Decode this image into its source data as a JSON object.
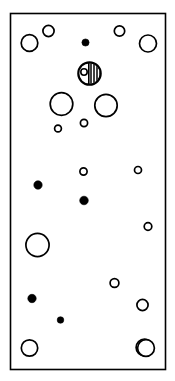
{
  "figure": {
    "type": "scientific-illustration",
    "canvas": {
      "width": 175,
      "height": 381
    },
    "background_color": "#ffffff",
    "stroke_color": "#000000",
    "fill_color": "#000000",
    "open_fill_color": "#ffffff"
  },
  "frame": {
    "name": "outer-rectangle",
    "x": 10.5,
    "y": 13.5,
    "width": 155,
    "height": 356,
    "stroke_width": 1.6
  },
  "chart_data": {
    "type": "scatter",
    "title": "",
    "xlabel": "",
    "ylabel": "",
    "xlim": [
      10,
      166
    ],
    "ylim": [
      13,
      370
    ],
    "grid": false,
    "legend": null,
    "series": [
      {
        "name": "open-circles",
        "style": "open",
        "stroke": "#000000",
        "fill": "#ffffff",
        "stroke_width": 1.7,
        "points": [
          {
            "id": "oc-1",
            "cx": 29.5,
            "cy": 43.0,
            "r": 8.3
          },
          {
            "id": "oc-2",
            "cx": 48.5,
            "cy": 31.0,
            "r": 5.6
          },
          {
            "id": "oc-3",
            "cx": 119.5,
            "cy": 31.0,
            "r": 5.2
          },
          {
            "id": "oc-4",
            "cx": 148.0,
            "cy": 43.5,
            "r": 8.5
          },
          {
            "id": "oc-5",
            "cx": 61.5,
            "cy": 104.0,
            "r": 11.3
          },
          {
            "id": "oc-6",
            "cx": 106.0,
            "cy": 105.5,
            "r": 11.2
          },
          {
            "id": "oc-7",
            "cx": 84.0,
            "cy": 123.0,
            "r": 3.6
          },
          {
            "id": "oc-8",
            "cx": 58.0,
            "cy": 128.5,
            "r": 3.4
          },
          {
            "id": "oc-9",
            "cx": 83.5,
            "cy": 171.5,
            "r": 3.6
          },
          {
            "id": "oc-10",
            "cx": 138.0,
            "cy": 170.0,
            "r": 3.5
          },
          {
            "id": "oc-11",
            "cx": 148.0,
            "cy": 226.5,
            "r": 3.8
          },
          {
            "id": "oc-12",
            "cx": 37.5,
            "cy": 245.0,
            "r": 11.6
          },
          {
            "id": "oc-13",
            "cx": 114.5,
            "cy": 283.0,
            "r": 4.4
          },
          {
            "id": "oc-14",
            "cx": 142.5,
            "cy": 305.0,
            "r": 5.6
          },
          {
            "id": "oc-15",
            "cx": 29.5,
            "cy": 348.0,
            "r": 8.2
          },
          {
            "id": "oc-16",
            "cx": 144.5,
            "cy": 347.5,
            "r": 8.4
          },
          {
            "id": "oc-17",
            "cx": 146.0,
            "cy": 348.0,
            "r": 8.4
          }
        ]
      },
      {
        "name": "filled-circles",
        "style": "filled",
        "stroke": "#000000",
        "fill": "#000000",
        "points": [
          {
            "id": "fc-1",
            "cx": 85.5,
            "cy": 42.5,
            "r": 3.6
          },
          {
            "id": "fc-2",
            "cx": 38.0,
            "cy": 185.0,
            "r": 4.2
          },
          {
            "id": "fc-3",
            "cx": 84.0,
            "cy": 200.5,
            "r": 4.3
          },
          {
            "id": "fc-4",
            "cx": 32.0,
            "cy": 298.5,
            "r": 4.2
          },
          {
            "id": "fc-5",
            "cx": 60.5,
            "cy": 320.0,
            "r": 3.3
          }
        ]
      },
      {
        "name": "hatched-marker",
        "style": "hatched-with-inclusion",
        "stroke": "#000000",
        "stroke_width": 2.2,
        "points": [
          {
            "id": "hm-1",
            "cx": 89.5,
            "cy": 73.5,
            "r": 11.2,
            "divider_x_offset": 1.5,
            "hatch_spacing": 3.0,
            "inclusion": {
              "cx": 84.0,
              "cy": 72.0,
              "r": 3.2
            }
          }
        ]
      }
    ],
    "counts": {
      "open_circles": 17,
      "filled_circles": 5,
      "hatched_markers": 1,
      "total": 23
    }
  }
}
